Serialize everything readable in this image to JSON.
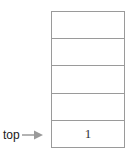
{
  "diagram": {
    "border_color": "#9a9a9a",
    "arrow_color": "#9a9a9a",
    "background": "#ffffff",
    "stack": {
      "name": "stack",
      "capacity": 5,
      "cells": [
        {
          "value": "",
          "filled": false
        },
        {
          "value": "",
          "filled": false
        },
        {
          "value": "",
          "filled": false
        },
        {
          "value": "",
          "filled": false
        },
        {
          "value": "1",
          "filled": true
        }
      ]
    },
    "pointer": {
      "label": "top",
      "icon": "arrow-right-icon",
      "points_to_cell_index": 4
    }
  }
}
